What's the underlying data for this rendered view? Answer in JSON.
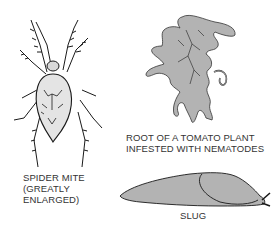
{
  "figures": [
    {
      "id": "spider-mite",
      "caption_lines": [
        "SPIDER MITE",
        "(GREATLY",
        "ENLARGED)"
      ]
    },
    {
      "id": "tomato-root",
      "caption_lines": [
        "ROOT OF A TOMATO PLANT",
        "INFESTED WITH NEMATODES"
      ]
    },
    {
      "id": "slug",
      "caption_lines": [
        "SLUG"
      ]
    }
  ],
  "colors": {
    "fill_gray": "#b3b3b3",
    "body_light": "#e4e4e4",
    "line": "#1a1a1a",
    "text": "#333333"
  }
}
